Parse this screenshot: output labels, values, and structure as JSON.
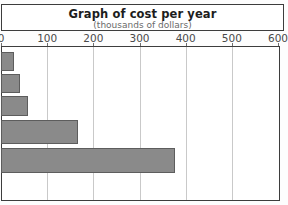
{
  "chart_data": {
    "type": "bar",
    "orientation": "horizontal",
    "title": "Graph of cost per year",
    "subtitle": "(thousands of dollars)",
    "xlabel": "",
    "ylabel": "",
    "xlim": [
      0,
      600
    ],
    "xticks": [
      0,
      100,
      200,
      300,
      400,
      500,
      600
    ],
    "xtick_labels": [
      "0",
      "100",
      "200",
      "300",
      "400",
      "500",
      "600"
    ],
    "categories": [
      "",
      "",
      "",
      "",
      ""
    ],
    "values": [
      26,
      39,
      56,
      165,
      375
    ],
    "grid": true,
    "legend": false,
    "colors": {
      "bar_fill": "#8a8a8a",
      "bar_border": "#5d5d5d",
      "frame": "#3d3d3d",
      "gridline": "#c9c9c9",
      "background": "#ffffff",
      "title_text": "#1d1d1d",
      "subtitle_text": "#6a6a6a",
      "tick_text": "#4a4a4a"
    }
  }
}
